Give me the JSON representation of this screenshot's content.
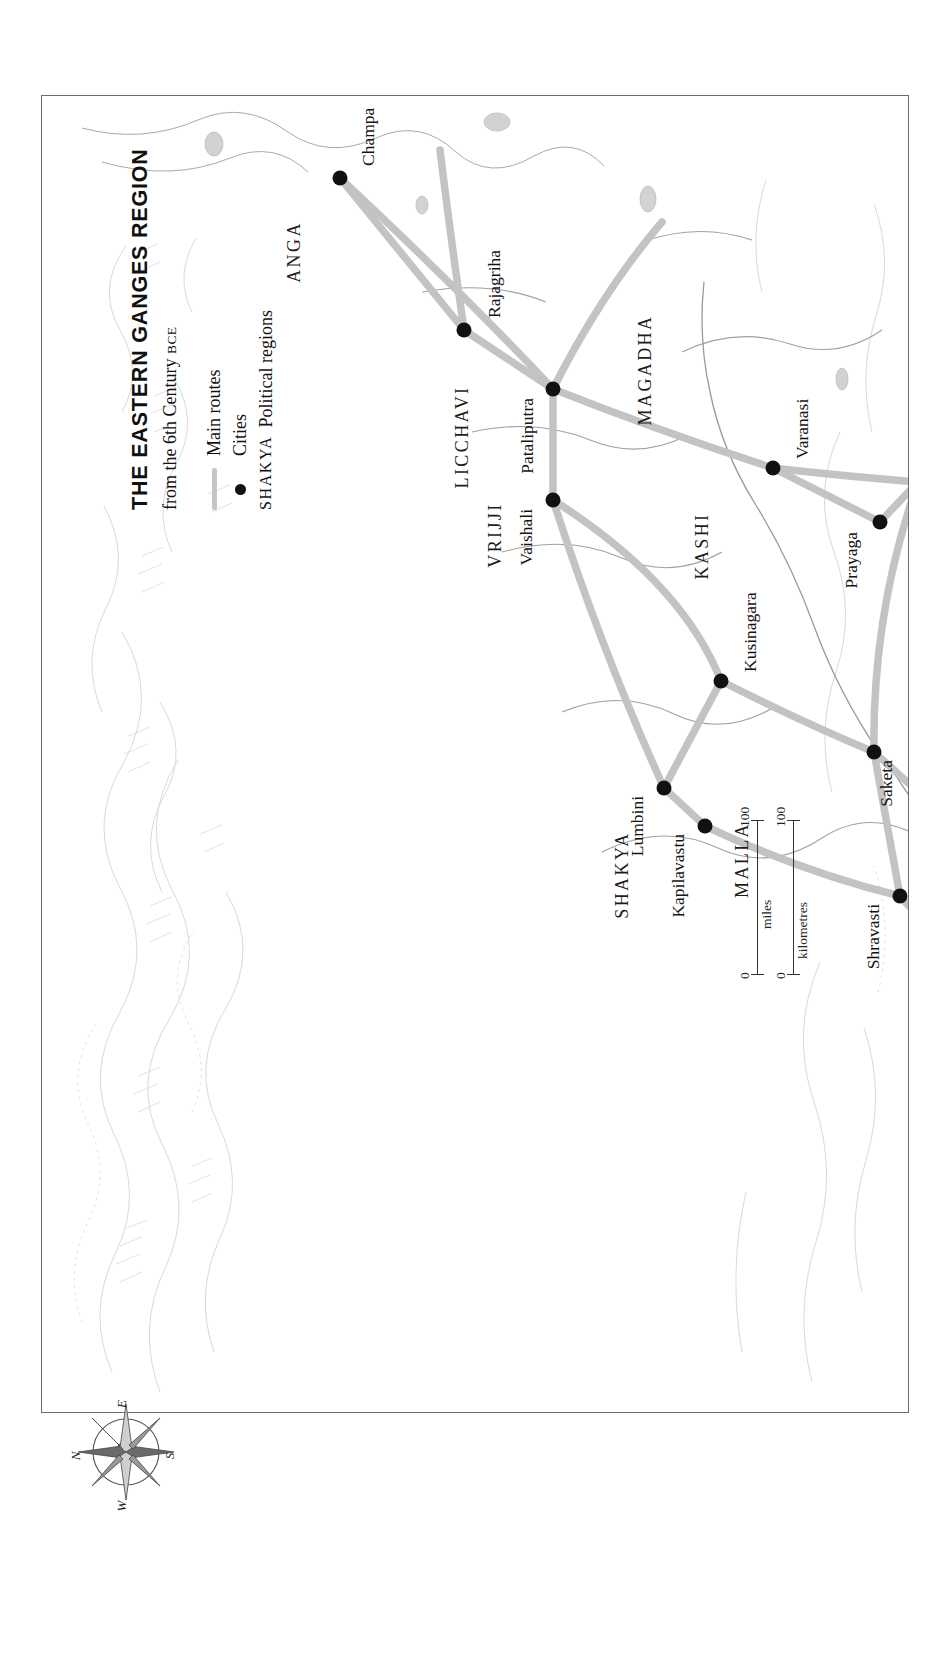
{
  "title": {
    "main": "THE EASTERN GANGES REGION",
    "sub_prefix": "from the 6th Century ",
    "sub_era": "BCE"
  },
  "legend": {
    "routes_label": "Main routes",
    "cities_label": "Cities",
    "regions_key": "SHAKYA",
    "regions_label": "Political regions"
  },
  "scale": {
    "miles_zero": "0",
    "miles_max": "100",
    "miles_unit": "miles",
    "km_zero": "0",
    "km_unit": "kilometres",
    "km_max": "100"
  },
  "compass": {
    "n": "N",
    "e": "E",
    "s": "S",
    "w": "W"
  },
  "colors": {
    "route": "#c3c3c3",
    "city_dot": "#111111",
    "river": "#9a9a9a",
    "border": "#6d6d6d",
    "relief": "#d6d6d6",
    "text": "#141414"
  },
  "map": {
    "cities": [
      {
        "name": "Champa",
        "x": 1234,
        "y": 298,
        "lx": 1246,
        "ly": 318,
        "anchor": "start"
      },
      {
        "name": "Rajagriha",
        "x": 1082,
        "y": 422,
        "lx": 1094,
        "ly": 444,
        "anchor": "start"
      },
      {
        "name": "Pataliputra",
        "x": 1023,
        "y": 511,
        "lx": 1014,
        "ly": 494,
        "anchor": "end"
      },
      {
        "name": "Vaishali",
        "x": 912,
        "y": 511,
        "lx": 903,
        "ly": 493,
        "anchor": "end"
      },
      {
        "name": "Lumbini",
        "x": 624,
        "y": 622,
        "lx": 616,
        "ly": 604,
        "anchor": "end"
      },
      {
        "name": "Kapilavastu",
        "x": 586,
        "y": 663,
        "lx": 578,
        "ly": 645,
        "anchor": "end"
      },
      {
        "name": "Kusinagara",
        "x": 731,
        "y": 679,
        "lx": 740,
        "ly": 700,
        "anchor": "start"
      },
      {
        "name": "Varanasi",
        "x": 944,
        "y": 731,
        "lx": 953,
        "ly": 752,
        "anchor": "start"
      },
      {
        "name": "Shravasti",
        "x": 516,
        "y": 858,
        "lx": 508,
        "ly": 840,
        "anchor": "end"
      },
      {
        "name": "Saketa",
        "x": 660,
        "y": 832,
        "lx": 652,
        "ly": 853,
        "anchor": "end"
      },
      {
        "name": "Prayaga",
        "x": 890,
        "y": 838,
        "lx": 880,
        "ly": 818,
        "anchor": "end"
      },
      {
        "name": "Kaushambi",
        "x": 930,
        "y": 876,
        "lx": 940,
        "ly": 896,
        "anchor": "start"
      },
      {
        "name": "Kanyakubja",
        "x": 487,
        "y": 1023,
        "lx": 478,
        "ly": 1005,
        "anchor": "end"
      },
      {
        "name": "Shamkasya",
        "x": 414,
        "y": 1085,
        "lx": 424,
        "ly": 1106,
        "anchor": "start"
      },
      {
        "name": "Ahicchatra",
        "x": 314,
        "y": 1040,
        "lx": 305,
        "ly": 1022,
        "anchor": "end"
      },
      {
        "name": "Mathura",
        "x": 196,
        "y": 1251,
        "lx": 188,
        "ly": 1272,
        "anchor": "end"
      }
    ],
    "regions": [
      {
        "name": "ANGA",
        "x": 1160,
        "y": 252
      },
      {
        "name": "LICCHAVI",
        "x": 975,
        "y": 420
      },
      {
        "name": "VRIJJI",
        "x": 877,
        "y": 453
      },
      {
        "name": "SHAKYA",
        "x": 537,
        "y": 580
      },
      {
        "name": "MALLA",
        "x": 552,
        "y": 700
      },
      {
        "name": "KASHI",
        "x": 866,
        "y": 660
      },
      {
        "name": "MAGADHA",
        "x": 1042,
        "y": 603
      },
      {
        "name": "KOSALA",
        "x": 430,
        "y": 918
      },
      {
        "name": "PANCHALA",
        "x": 345,
        "y": 985
      },
      {
        "name": "VATSA",
        "x": 880,
        "y": 1005
      }
    ],
    "rivers": [
      {
        "name": "Ganges R.",
        "x": 650,
        "y": 955,
        "rot": -30
      },
      {
        "name": "Yamuna R.",
        "x": 528,
        "y": 1110,
        "rot": -30
      }
    ]
  }
}
